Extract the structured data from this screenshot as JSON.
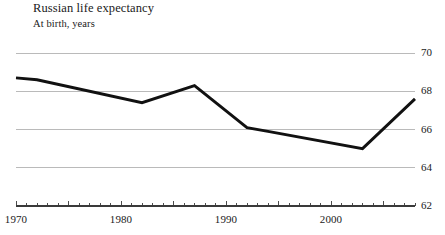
{
  "chart_data": {
    "type": "line",
    "title": "Russian life expectancy",
    "subtitle": "At birth, years",
    "xlabel": "",
    "ylabel": "",
    "xlim": [
      1970,
      2008
    ],
    "ylim": [
      62,
      70
    ],
    "grid": true,
    "legend_position": "none",
    "y_ticks": [
      70,
      68,
      66,
      64,
      62
    ],
    "y_tick_labels": [
      "70",
      "68",
      "66",
      "64",
      "62"
    ],
    "x_ticks": [
      1970,
      1980,
      1990,
      2000
    ],
    "x_tick_labels": [
      "1970",
      "1980",
      "1990",
      "2000"
    ],
    "x_minor_tick_interval": 1,
    "x_major_tick_interval": 5,
    "series": [
      {
        "name": "Life expectancy at birth",
        "color": "#111111",
        "x": [
          1970,
          1972,
          1982,
          1987,
          1992,
          1994,
          2003,
          2008
        ],
        "values": [
          68.7,
          68.6,
          67.4,
          68.3,
          66.1,
          65.9,
          65.0,
          67.6
        ]
      }
    ]
  },
  "axis": {
    "y_labels": [
      "70",
      "68",
      "66",
      "64",
      "62"
    ],
    "x_labels": [
      "1970",
      "1980",
      "1990",
      "2000"
    ]
  },
  "colors": {
    "line": "#111111",
    "gridline": "#a9a9a9",
    "axis": "#3a3a3a",
    "text": "#1a1a1a",
    "background": "#ffffff"
  }
}
